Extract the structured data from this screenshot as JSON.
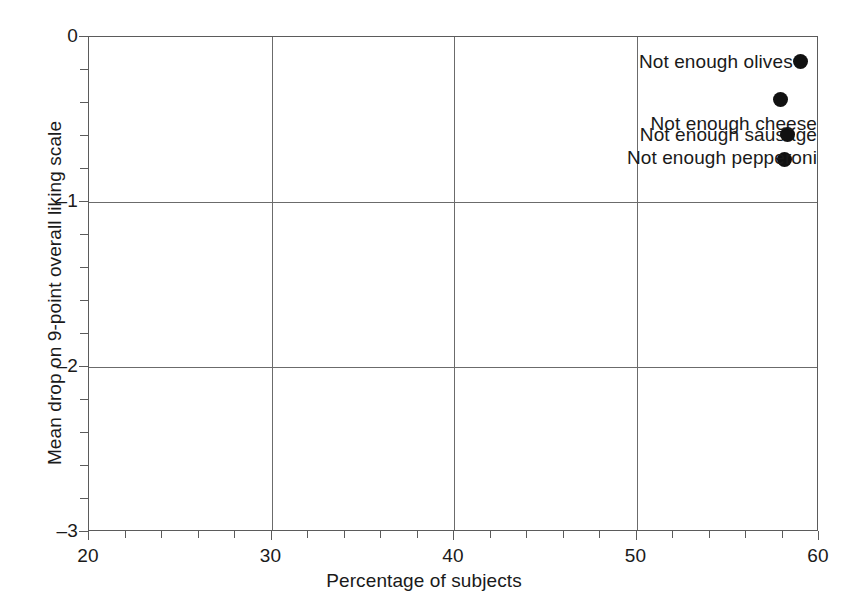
{
  "chart_data": {
    "type": "scatter",
    "title": "",
    "xlabel": "Percentage of subjects",
    "ylabel": "Mean drop on 9-point overall liking scale",
    "xlim": [
      20,
      60
    ],
    "ylim": [
      0,
      -3
    ],
    "y_axis_inverted": true,
    "grid": true,
    "legend": "none",
    "x_ticks_major": [
      20,
      30,
      40,
      50,
      60
    ],
    "x_tick_labels": [
      "20",
      "30",
      "40",
      "50",
      "60"
    ],
    "x_tick_minor_step": 2,
    "y_ticks_major": [
      0,
      -1,
      -2,
      -3
    ],
    "y_tick_labels": [
      "0",
      "–1",
      "–2",
      "–3"
    ],
    "y_tick_minor_step": 0.2,
    "points": [
      {
        "label": "Not enough sausage",
        "x": 58.1,
        "y": -0.74,
        "label_position": "above-left"
      },
      {
        "label": "Not enough pepperoni",
        "x": 58.3,
        "y": -0.59,
        "label_position": "below-left"
      },
      {
        "label": "Not enough cheese",
        "x": 57.9,
        "y": -0.38,
        "label_position": "below-left"
      },
      {
        "label": "Not enough olives",
        "x": 59.0,
        "y": -0.15,
        "label_position": "left"
      }
    ]
  }
}
